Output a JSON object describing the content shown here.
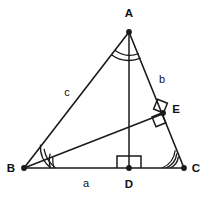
{
  "figure": {
    "type": "geometry-diagram",
    "width": 205,
    "height": 197,
    "background_color": "#ffffff",
    "stroke_color": "#1a1a1a"
  },
  "points": {
    "A": {
      "label": "A",
      "x": 129,
      "y": 32,
      "label_x": 129,
      "label_y": 17
    },
    "B": {
      "label": "B",
      "x": 24,
      "y": 168,
      "label_x": 12,
      "label_y": 172
    },
    "C": {
      "label": "C",
      "x": 184,
      "y": 168,
      "label_x": 195,
      "label_y": 172
    },
    "D": {
      "label": "D",
      "x": 129,
      "y": 168,
      "label_x": 129,
      "label_y": 188
    },
    "E": {
      "label": "E",
      "x": 163,
      "y": 114,
      "label_x": 175,
      "label_y": 113
    }
  },
  "sides": {
    "a": {
      "label": "a",
      "from": "B",
      "to": "C",
      "label_x": 86,
      "label_y": 186
    },
    "b": {
      "label": "b",
      "from": "A",
      "to": "C",
      "label_x": 162,
      "label_y": 83
    },
    "c": {
      "label": "c",
      "from": "A",
      "to": "B",
      "label_x": 67,
      "label_y": 96
    }
  },
  "segments": [
    {
      "name": "side-ab",
      "from": "A",
      "to": "B",
      "kind": "edge"
    },
    {
      "name": "side-ac",
      "from": "A",
      "to": "C",
      "kind": "edge"
    },
    {
      "name": "side-bc",
      "from": "B",
      "to": "C",
      "kind": "edge"
    },
    {
      "name": "altitude-ad",
      "from": "A",
      "to": "D",
      "kind": "cevian"
    },
    {
      "name": "altitude-be",
      "from": "B",
      "to": "E",
      "kind": "cevian"
    }
  ],
  "angle_marks": [
    {
      "name": "angle-arcs-at-a",
      "vertex": "A",
      "arc_count": 2,
      "note": "angle at apex A, split by AD"
    },
    {
      "name": "angle-arcs-at-b",
      "vertex": "B",
      "arc_count": 3,
      "note": "angle at B, split by BE"
    },
    {
      "name": "angle-arcs-at-c",
      "vertex": "C",
      "arc_count": 3,
      "note": "angle at C"
    }
  ],
  "right_angles": [
    {
      "name": "right-angle-at-d",
      "vertex": "D",
      "note": "AD perpendicular to BC"
    },
    {
      "name": "right-angle-at-e-upper",
      "vertex": "E",
      "note": "BE perpendicular to AC, upper side"
    },
    {
      "name": "right-angle-at-e-lower",
      "vertex": "E",
      "note": "BE perpendicular to AC, lower side"
    }
  ]
}
